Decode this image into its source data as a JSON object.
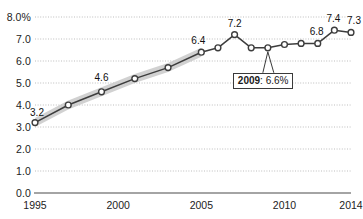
{
  "chart_data": {
    "type": "line",
    "title": "",
    "subtitle": "",
    "xlabel": "",
    "ylabel": "",
    "ylim": [
      0.0,
      8.0
    ],
    "xlim": [
      1995,
      2014
    ],
    "grid": true,
    "legend": null,
    "y_ticks": [
      "0.0",
      "1.0",
      "2.0",
      "3.0",
      "4.0",
      "5.0",
      "6.0",
      "7.0",
      "8.0%"
    ],
    "y_tick_values": [
      0.0,
      1.0,
      2.0,
      3.0,
      4.0,
      5.0,
      6.0,
      7.0,
      8.0
    ],
    "x_ticks": [
      "1995",
      "2000",
      "2005",
      "2010",
      "2014"
    ],
    "x_tick_values": [
      1995,
      2000,
      2005,
      2010,
      2014
    ],
    "x": [
      1995,
      1997,
      1999,
      2001,
      2003,
      2005,
      2006,
      2007,
      2008,
      2009,
      2010,
      2011,
      2012,
      2013,
      2014
    ],
    "values": [
      3.2,
      4.0,
      4.6,
      5.2,
      5.7,
      6.4,
      6.6,
      7.2,
      6.6,
      6.6,
      6.75,
      6.8,
      6.8,
      7.4,
      7.3
    ],
    "series": [
      {
        "name": "rate",
        "values": [
          3.2,
          4.0,
          4.6,
          5.2,
          5.7,
          6.4,
          6.6,
          7.2,
          6.6,
          6.6,
          6.75,
          6.8,
          6.8,
          7.4,
          7.3
        ],
        "line_color": "#3d3d3d",
        "marker_face": "#ffffff",
        "marker_edge": "#3d3d3d"
      }
    ],
    "confidence_band": {
      "color": "#c9c9c9",
      "x_start": 1995,
      "x_end": 2005
    },
    "point_labels": [
      {
        "x": 1995,
        "y": 3.2,
        "text": "3.2"
      },
      {
        "x": 1999,
        "y": 4.6,
        "text": "4.6"
      },
      {
        "x": 2005,
        "y": 6.4,
        "text": "6.4"
      },
      {
        "x": 2007,
        "y": 7.2,
        "text": "7.2"
      },
      {
        "x": 2012,
        "y": 6.8,
        "text": "6.8"
      },
      {
        "x": 2013,
        "y": 7.4,
        "text": "7.4"
      },
      {
        "x": 2014,
        "y": 7.3,
        "text": "7.3"
      }
    ],
    "annotations": [
      {
        "name": "callout-2009",
        "year_label": "2009",
        "value_label": ": 6.6%",
        "full_text": "2009: 6.6%",
        "points_to_x": 2009,
        "points_to_y": 6.6
      }
    ],
    "colors": {
      "gridline": "#bdbdbd",
      "axis": "#4a4a4a",
      "text": "#1a1a1a",
      "band": "#c9c9c9",
      "line": "#3d3d3d"
    }
  }
}
